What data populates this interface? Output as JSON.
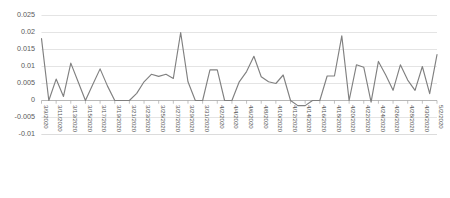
{
  "chart_data": {
    "type": "line",
    "title": "",
    "subtitle": "",
    "xlabel": "",
    "ylabel": "",
    "grid": true,
    "legend": false,
    "legend_position": "none",
    "line_color": "#808080",
    "gridline_color": "#d9d9d9",
    "axis_color": "#a6a6a6",
    "label_color": "#595959",
    "ylim": [
      -0.01,
      0.025
    ],
    "ytick_labels": [
      "0.025",
      "0.02",
      "0.015",
      "0.01",
      "0.005",
      "0",
      "-0.005",
      "-0.01"
    ],
    "ytick_values": [
      0.025,
      0.02,
      0.015,
      0.01,
      0.005,
      0,
      -0.005,
      -0.01
    ],
    "xtick_labels": [
      "3/9/2020",
      "3/11/2020",
      "3/13/2020",
      "3/15/2020",
      "3/17/2020",
      "3/19/2020",
      "3/21/2020",
      "3/23/2020",
      "3/25/2020",
      "3/27/2020",
      "3/29/2020",
      "3/31/2020",
      "4/2/2020",
      "4/4/2020",
      "4/6/2020",
      "4/8/2020",
      "4/10/2020",
      "4/12/2020",
      "4/14/2020",
      "4/16/2020",
      "4/18/2020",
      "4/20/2020",
      "4/22/2020",
      "4/24/2020",
      "4/26/2020",
      "4/28/2020",
      "4/30/2020",
      "5/2/2020"
    ],
    "x": [
      "3/9/2020",
      "3/10/2020",
      "3/11/2020",
      "3/12/2020",
      "3/13/2020",
      "3/14/2020",
      "3/15/2020",
      "3/16/2020",
      "3/17/2020",
      "3/18/2020",
      "3/19/2020",
      "3/20/2020",
      "3/21/2020",
      "3/22/2020",
      "3/23/2020",
      "3/24/2020",
      "3/25/2020",
      "3/26/2020",
      "3/27/2020",
      "3/28/2020",
      "3/29/2020",
      "3/30/2020",
      "3/31/2020",
      "4/1/2020",
      "4/2/2020",
      "4/3/2020",
      "4/4/2020",
      "4/5/2020",
      "4/6/2020",
      "4/7/2020",
      "4/8/2020",
      "4/9/2020",
      "4/10/2020",
      "4/11/2020",
      "4/12/2020",
      "4/13/2020",
      "4/14/2020",
      "4/15/2020",
      "4/16/2020",
      "4/17/2020",
      "4/18/2020",
      "4/19/2020",
      "4/20/2020",
      "4/21/2020",
      "4/22/2020",
      "4/23/2020",
      "4/24/2020",
      "4/25/2020",
      "4/26/2020",
      "4/27/2020",
      "4/28/2020",
      "4/29/2020",
      "4/30/2020",
      "5/1/2020",
      "5/2/2020"
    ],
    "values": [
      0.0182,
      0.0,
      0.0063,
      0.0012,
      0.011,
      0.0055,
      0.0,
      0.0047,
      0.0093,
      0.0043,
      0.0,
      0.0,
      0.0,
      0.0021,
      0.0055,
      0.0077,
      0.0071,
      0.0077,
      0.0065,
      0.02,
      0.0055,
      0.0,
      0.0,
      0.009,
      0.009,
      0.0,
      0.0,
      0.0055,
      0.0085,
      0.013,
      0.007,
      0.0055,
      0.005,
      0.0075,
      0.0,
      -0.0015,
      -0.0015,
      0.0,
      0.0,
      0.0072,
      0.0072,
      0.019,
      0.0,
      0.0105,
      0.0098,
      -0.0005,
      0.0115,
      0.0075,
      0.003,
      0.0105,
      0.006,
      0.003,
      0.01,
      0.002,
      0.0135
    ]
  }
}
